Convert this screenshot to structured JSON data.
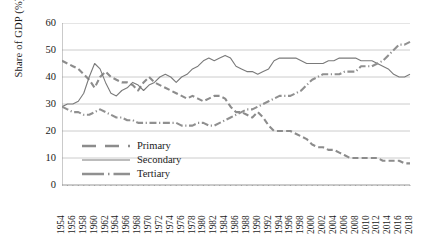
{
  "chart_data": {
    "type": "line",
    "title": "",
    "xlabel": "",
    "ylabel": "Share of GDP (%)",
    "ylim": [
      0,
      60
    ],
    "ytick_values": [
      0,
      10,
      20,
      30,
      40,
      50,
      60
    ],
    "ytick_labels": [
      "0",
      "10",
      "20",
      "30",
      "40",
      "50",
      "60"
    ],
    "grid": "horizontal",
    "legend_position": "inside-lower-left",
    "xlim": [
      1954,
      2018
    ],
    "xtick_labels": [
      "1954",
      "1956",
      "1958",
      "1960",
      "1962",
      "1964",
      "1966",
      "1968",
      "1970",
      "1972",
      "1974",
      "1976",
      "1978",
      "1980",
      "1982",
      "1984",
      "1986",
      "1988",
      "1990",
      "1992",
      "1994",
      "1996",
      "1998",
      "2000",
      "2002",
      "2004",
      "2006",
      "2008",
      "2010",
      "2012",
      "2014",
      "2016",
      "2018"
    ],
    "x": [
      1954,
      1955,
      1956,
      1957,
      1958,
      1959,
      1960,
      1961,
      1962,
      1963,
      1964,
      1965,
      1966,
      1967,
      1968,
      1969,
      1970,
      1971,
      1972,
      1973,
      1974,
      1975,
      1976,
      1977,
      1978,
      1979,
      1980,
      1981,
      1982,
      1983,
      1984,
      1985,
      1986,
      1987,
      1988,
      1989,
      1990,
      1991,
      1992,
      1993,
      1994,
      1995,
      1996,
      1997,
      1998,
      1999,
      2000,
      2001,
      2002,
      2003,
      2004,
      2005,
      2006,
      2007,
      2008,
      2009,
      2010,
      2011,
      2012,
      2013,
      2014,
      2015,
      2016,
      2017,
      2018
    ],
    "series": [
      {
        "name": "Primary",
        "style": "dashed",
        "color": "#8c8c8c",
        "values": [
          46,
          45,
          44,
          43,
          41,
          39,
          36,
          40,
          42,
          40,
          39,
          38,
          38,
          37,
          35,
          38,
          40,
          38,
          37,
          36,
          35,
          34,
          33,
          32,
          33,
          32,
          31,
          32,
          33,
          33,
          32,
          29,
          27,
          27,
          26,
          25,
          27,
          25,
          22,
          20,
          20,
          20,
          20,
          19,
          18,
          17,
          15,
          14,
          14,
          13,
          13,
          12,
          11,
          10,
          10,
          10,
          10,
          10,
          10,
          9,
          9,
          9,
          9,
          8,
          8
        ]
      },
      {
        "name": "Secondary",
        "style": "solid",
        "color": "#7a7a7a",
        "values": [
          29,
          30,
          30,
          31,
          34,
          40,
          45,
          43,
          38,
          34,
          33,
          35,
          36,
          38,
          37,
          35,
          37,
          38,
          40,
          41,
          40,
          38,
          40,
          41,
          43,
          44,
          46,
          47,
          46,
          47,
          48,
          47,
          44,
          43,
          42,
          42,
          41,
          42,
          43,
          46,
          47,
          47,
          47,
          47,
          46,
          45,
          45,
          45,
          45,
          46,
          46,
          47,
          47,
          47,
          47,
          46,
          46,
          46,
          45,
          44,
          43,
          41,
          40,
          40,
          41
        ]
      },
      {
        "name": "Tertiary",
        "style": "dashdot",
        "color": "#909090",
        "values": [
          29,
          28,
          27,
          27,
          26,
          26,
          27,
          28,
          27,
          26,
          25,
          25,
          24,
          24,
          23,
          23,
          23,
          23,
          23,
          23,
          23,
          23,
          22,
          22,
          22,
          23,
          23,
          22,
          22,
          23,
          24,
          25,
          26,
          27,
          28,
          28,
          29,
          30,
          31,
          32,
          33,
          33,
          33,
          34,
          35,
          37,
          39,
          40,
          41,
          41,
          41,
          41,
          42,
          42,
          42,
          44,
          44,
          44,
          45,
          46,
          48,
          50,
          52,
          52,
          53
        ]
      }
    ]
  },
  "legend": {
    "items": [
      {
        "label": "Primary"
      },
      {
        "label": "Secondary"
      },
      {
        "label": "Tertiary"
      }
    ]
  }
}
